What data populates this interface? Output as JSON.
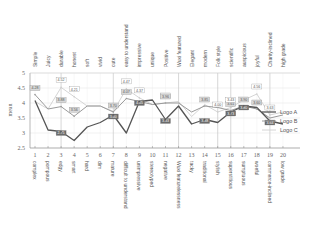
{
  "chart_data": {
    "type": "line",
    "title": "",
    "xlabel": "",
    "ylabel": "mean",
    "ylim": [
      2.5,
      5
    ],
    "yticks": [
      2.5,
      3,
      3.5,
      4,
      4.5,
      5
    ],
    "grid": true,
    "legend_position": "right",
    "x": [
      1,
      2,
      3,
      4,
      5,
      6,
      7,
      8,
      9,
      10,
      11,
      12,
      13,
      14,
      15,
      16,
      17,
      18,
      19,
      20
    ],
    "top_labels": [
      "Simple",
      "Juicy",
      "durable",
      "honest",
      "soft",
      "vivid",
      "cute",
      "easy to understand",
      "impressive",
      "unique",
      "Positive",
      "Wuxi featured",
      "Elegant",
      "modern",
      "Folk style",
      "scientific",
      "auspicious",
      "joyful",
      "Charity-inclined",
      "high grade"
    ],
    "bottom_labels": [
      "complex",
      "pompous",
      "edgy",
      "smart",
      "hard",
      "dim",
      "mature",
      "difficult to understand",
      "unimpressive",
      "stereotyped",
      "negative",
      "Wuxi featurelessness",
      "tacky",
      "traditional",
      "stylish",
      "superstitious",
      "sumptuous",
      "woeful",
      "commerce-inclined",
      "low grade"
    ],
    "series": [
      {
        "name": "Logo A",
        "color": "#555555",
        "width": 1.3,
        "values": [
          4.08,
          3.1,
          3.05,
          2.75,
          3.2,
          3.35,
          3.6,
          3.0,
          4.05,
          4.1,
          3.45,
          3.9,
          3.3,
          3.45,
          3.35,
          3.7,
          3.9,
          3.85,
          3.4,
          3.3
        ]
      },
      {
        "name": "Logo B",
        "color": "#9a9a9a",
        "width": 1.0,
        "values": [
          4.28,
          3.8,
          3.88,
          3.56,
          3.9,
          3.9,
          3.7,
          4.15,
          4.05,
          3.95,
          4.0,
          4.0,
          3.7,
          3.9,
          3.85,
          3.75,
          3.9,
          3.8,
          3.5,
          3.6
        ]
      },
      {
        "name": "Logo C",
        "color": "#cfcfcf",
        "width": 0.9,
        "values": [
          4.05,
          3.8,
          4.52,
          4.21,
          3.9,
          3.9,
          3.72,
          4.47,
          4.17,
          3.95,
          4.0,
          4.05,
          3.55,
          3.95,
          3.7,
          3.85,
          4.1,
          4.3,
          3.6,
          3.7
        ]
      }
    ],
    "data_labels": [
      {
        "series": 1,
        "x": 1,
        "text": "4.28"
      },
      {
        "series": 2,
        "x": 3,
        "text": "4.52"
      },
      {
        "series": 2,
        "x": 4,
        "text": "4.21"
      },
      {
        "series": 1,
        "x": 3,
        "text": "3.88"
      },
      {
        "series": 1,
        "x": 4,
        "text": "3.56"
      },
      {
        "series": 0,
        "x": 3,
        "text": "2.75"
      },
      {
        "series": 2,
        "x": 8,
        "text": "4.47"
      },
      {
        "series": 2,
        "x": 9,
        "text": "4.37"
      },
      {
        "series": 1,
        "x": 8,
        "text": "4.07"
      },
      {
        "series": 0,
        "x": 9,
        "text": "4.05"
      },
      {
        "series": 1,
        "x": 7,
        "text": "3.70"
      },
      {
        "series": 0,
        "x": 7,
        "text": "3.00"
      },
      {
        "series": 2,
        "x": 11,
        "text": "4.02"
      },
      {
        "series": 1,
        "x": 11,
        "text": "3.96"
      },
      {
        "series": 0,
        "x": 11,
        "text": "3.33"
      },
      {
        "series": 0,
        "x": 14,
        "text": "3.38"
      },
      {
        "series": 2,
        "x": 15,
        "text": "4.00"
      },
      {
        "series": 1,
        "x": 14,
        "text": "3.85"
      },
      {
        "series": 0,
        "x": 16,
        "text": "3.73"
      },
      {
        "series": 1,
        "x": 16,
        "text": "3.61"
      },
      {
        "series": 2,
        "x": 16,
        "text": "3.43"
      },
      {
        "series": 1,
        "x": 17,
        "text": "3.90"
      },
      {
        "series": 0,
        "x": 17,
        "text": "3.80"
      },
      {
        "series": 2,
        "x": 18,
        "text": "4.56"
      },
      {
        "series": 1,
        "x": 18,
        "text": "3.60"
      },
      {
        "series": 2,
        "x": 19,
        "text": "3.63"
      },
      {
        "series": 0,
        "x": 19,
        "text": "3.64"
      }
    ]
  }
}
